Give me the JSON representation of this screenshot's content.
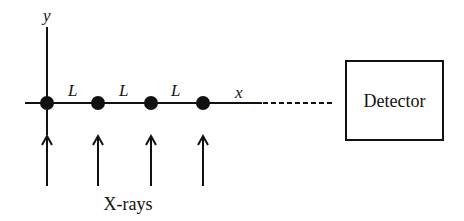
{
  "diagram": {
    "axes": {
      "y_label": "y",
      "x_label": "x"
    },
    "spacing_labels": [
      "L",
      "L",
      "L"
    ],
    "atoms": [
      {
        "id": "atom-1",
        "x": 47
      },
      {
        "id": "atom-2",
        "x": 98
      },
      {
        "id": "atom-3",
        "x": 151
      },
      {
        "id": "atom-4",
        "x": 203
      }
    ],
    "detector": {
      "label": "Detector"
    },
    "beam": {
      "label": "X-rays",
      "arrow_count": 4
    },
    "colors": {
      "stroke": "#111111",
      "background": "#ffffff"
    }
  }
}
